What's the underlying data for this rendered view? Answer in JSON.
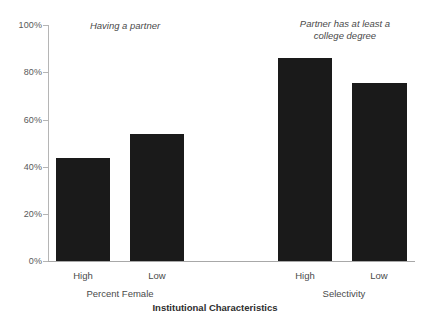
{
  "chart_data": {
    "type": "bar",
    "title": "",
    "xlabel": "Institutional Characteristics",
    "ylabel": "",
    "ylim": [
      0,
      100
    ],
    "grid": false,
    "legend_position": "none",
    "categories": [
      "High",
      "Low",
      "High",
      "Low"
    ],
    "values": [
      43.5,
      54.0,
      86.0,
      75.5
    ],
    "groups": [
      {
        "label": "Percent Female",
        "categories": [
          "High",
          "Low"
        ],
        "values": [
          43.5,
          54.0
        ]
      },
      {
        "label": "Selectivity",
        "categories": [
          "High",
          "Low"
        ],
        "values": [
          86.0,
          75.5
        ]
      }
    ],
    "ytick_labels": [
      "0%",
      "20%",
      "40%",
      "60%",
      "80%",
      "100%"
    ],
    "ytick_values": [
      0,
      20,
      40,
      60,
      80,
      100
    ],
    "annotations": [
      {
        "text": "Having a partner",
        "style": "italic"
      },
      {
        "text": "Partner has at least a\ncollege degree",
        "style": "italic"
      }
    ],
    "bar_color": "#1a1a1a",
    "axis_color": "#b5b5b5",
    "background_color": "#ffffff"
  },
  "axis": {
    "title": "Institutional Characteristics",
    "ticks": [
      {
        "label": "100%",
        "value": 100
      },
      {
        "label": "80%",
        "value": 80
      },
      {
        "label": "60%",
        "value": 60
      },
      {
        "label": "40%",
        "value": 40
      },
      {
        "label": "20%",
        "value": 20
      },
      {
        "label": "0%",
        "value": 0
      }
    ]
  },
  "annotations": {
    "left": "Having a partner",
    "right": "Partner has at least a\ncollege degree"
  },
  "bars": [
    {
      "name": "percent-female-high",
      "category": "High",
      "value": 43.5
    },
    {
      "name": "percent-female-low",
      "category": "Low",
      "value": 54.0
    },
    {
      "name": "selectivity-high",
      "category": "High",
      "value": 86.0
    },
    {
      "name": "selectivity-low",
      "category": "Low",
      "value": 75.5
    }
  ],
  "group_labels": {
    "left": "Percent Female",
    "right": "Selectivity"
  }
}
